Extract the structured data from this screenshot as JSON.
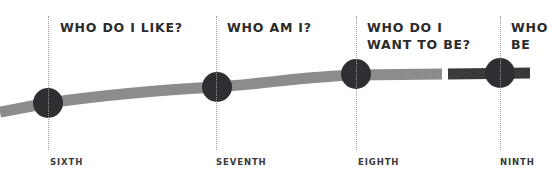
{
  "diagram": {
    "type": "timeline",
    "colors": {
      "line_light": "#8c8c8c",
      "line_dark": "#3a3a3a",
      "node": "#2f2f33",
      "text": "#2b2b2b",
      "guide": "#9a9a9a"
    },
    "stages": [
      {
        "question": "WHO DO I LIKE?",
        "grade": "SIXTH"
      },
      {
        "question": "WHO AM I?",
        "grade": "SEVENTH"
      },
      {
        "question": "WHO DO I\nWANT TO BE?",
        "grade": "EIGHTH"
      },
      {
        "question": "WHO\nBE",
        "grade": "NINTH"
      }
    ]
  }
}
